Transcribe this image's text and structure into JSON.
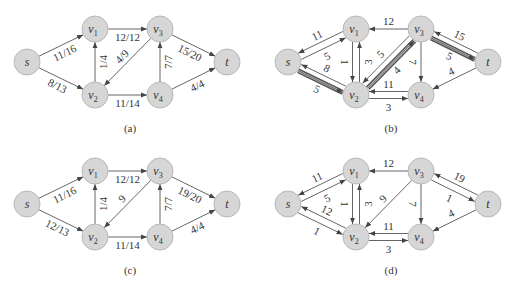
{
  "figure": {
    "nodes": [
      {
        "id": "s",
        "name": "s",
        "sub": "",
        "x": 27,
        "y": 62
      },
      {
        "id": "v1",
        "name": "v",
        "sub": "1",
        "x": 95,
        "y": 29
      },
      {
        "id": "v2",
        "name": "v",
        "sub": "2",
        "x": 95,
        "y": 95
      },
      {
        "id": "v3",
        "name": "v",
        "sub": "3",
        "x": 160,
        "y": 29
      },
      {
        "id": "v4",
        "name": "v",
        "sub": "4",
        "x": 160,
        "y": 95
      },
      {
        "id": "t",
        "name": "t",
        "sub": "",
        "x": 227,
        "y": 62
      }
    ],
    "panels": [
      {
        "id": "a",
        "caption": "(a)",
        "offset": [
          0,
          0
        ],
        "edges": [
          {
            "from": "s",
            "to": "v1",
            "label": "11/16"
          },
          {
            "from": "s",
            "to": "v2",
            "label": "8/13"
          },
          {
            "from": "v2",
            "to": "v1",
            "label": "1/4"
          },
          {
            "from": "v1",
            "to": "v3",
            "label": "12/12"
          },
          {
            "from": "v3",
            "to": "v2",
            "label": "4/9"
          },
          {
            "from": "v2",
            "to": "v4",
            "label": "11/14"
          },
          {
            "from": "v4",
            "to": "v3",
            "label": "7/7"
          },
          {
            "from": "v3",
            "to": "t",
            "label": "15/20"
          },
          {
            "from": "v4",
            "to": "t",
            "label": "4/4"
          }
        ]
      },
      {
        "id": "b",
        "caption": "(b)",
        "offset": [
          261,
          0
        ],
        "augmenting_path": [
          "s",
          "v2",
          "v3",
          "t"
        ],
        "edges": [
          {
            "from": "s",
            "to": "v1",
            "label": "5"
          },
          {
            "from": "v1",
            "to": "s",
            "label": "11"
          },
          {
            "from": "s",
            "to": "v2",
            "label": "5",
            "highlight": true
          },
          {
            "from": "v2",
            "to": "s",
            "label": "8"
          },
          {
            "from": "v1",
            "to": "v2",
            "label": "1"
          },
          {
            "from": "v2",
            "to": "v1",
            "label": "3"
          },
          {
            "from": "v3",
            "to": "v1",
            "label": "12"
          },
          {
            "from": "v2",
            "to": "v3",
            "label": "4",
            "highlight": true
          },
          {
            "from": "v3",
            "to": "v2",
            "label": "5"
          },
          {
            "from": "v2",
            "to": "v4",
            "label": "3"
          },
          {
            "from": "v4",
            "to": "v2",
            "label": "11"
          },
          {
            "from": "v3",
            "to": "v4",
            "label": "7"
          },
          {
            "from": "v3",
            "to": "t",
            "label": "5",
            "highlight": true
          },
          {
            "from": "t",
            "to": "v3",
            "label": "15"
          },
          {
            "from": "t",
            "to": "v4",
            "label": "4"
          }
        ]
      },
      {
        "id": "c",
        "caption": "(c)",
        "offset": [
          0,
          142
        ],
        "edges": [
          {
            "from": "s",
            "to": "v1",
            "label": "11/16"
          },
          {
            "from": "s",
            "to": "v2",
            "label": "12/13"
          },
          {
            "from": "v2",
            "to": "v1",
            "label": "1/4"
          },
          {
            "from": "v1",
            "to": "v3",
            "label": "12/12"
          },
          {
            "from": "v3",
            "to": "v2",
            "label": "9"
          },
          {
            "from": "v2",
            "to": "v4",
            "label": "11/14"
          },
          {
            "from": "v4",
            "to": "v3",
            "label": "7/7"
          },
          {
            "from": "v3",
            "to": "t",
            "label": "19/20"
          },
          {
            "from": "v4",
            "to": "t",
            "label": "4/4"
          }
        ]
      },
      {
        "id": "d",
        "caption": "(d)",
        "offset": [
          261,
          142
        ],
        "edges": [
          {
            "from": "s",
            "to": "v1",
            "label": "5"
          },
          {
            "from": "v1",
            "to": "s",
            "label": "11"
          },
          {
            "from": "s",
            "to": "v2",
            "label": "1"
          },
          {
            "from": "v2",
            "to": "s",
            "label": "12"
          },
          {
            "from": "v1",
            "to": "v2",
            "label": "1"
          },
          {
            "from": "v2",
            "to": "v1",
            "label": "3"
          },
          {
            "from": "v3",
            "to": "v1",
            "label": "12"
          },
          {
            "from": "v3",
            "to": "v2",
            "label": "9"
          },
          {
            "from": "v2",
            "to": "v4",
            "label": "3"
          },
          {
            "from": "v4",
            "to": "v2",
            "label": "11"
          },
          {
            "from": "v3",
            "to": "v4",
            "label": "7"
          },
          {
            "from": "v3",
            "to": "t",
            "label": "1"
          },
          {
            "from": "t",
            "to": "v3",
            "label": "19"
          },
          {
            "from": "t",
            "to": "v4",
            "label": "4"
          }
        ]
      }
    ]
  }
}
